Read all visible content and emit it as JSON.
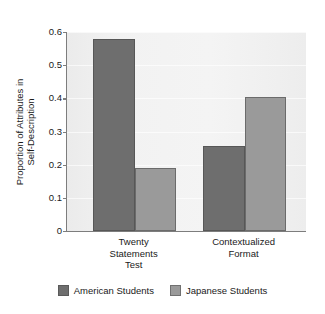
{
  "chart_data": {
    "type": "bar",
    "title": "",
    "subtitle": "",
    "xlabel": "",
    "ylabel": "Proportion of Attributes in Self-Description",
    "ylabel_lines": [
      "Proportion of Attributes in",
      "Self-Description"
    ],
    "categories": [
      "Twenty Statements Test",
      "Contextualized Format"
    ],
    "category_lines": [
      [
        "Twenty",
        "Statements",
        "Test"
      ],
      [
        "Contextualized",
        "Format"
      ]
    ],
    "series": [
      {
        "name": "American Students",
        "color": "#6e6e6e",
        "values": [
          0.58,
          0.255
        ]
      },
      {
        "name": "Japanese Students",
        "color": "#9a9a9a",
        "values": [
          0.19,
          0.405
        ]
      }
    ],
    "ylim": [
      0,
      0.6
    ],
    "yticks": [
      0,
      0.1,
      0.2,
      0.3,
      0.4,
      0.5,
      0.6
    ],
    "ytick_labels": [
      "0",
      "0.1",
      "0.2",
      "0.3",
      "0.4",
      "0.5",
      "0.6"
    ],
    "grid": "horizontal-light",
    "legend_position": "bottom-center",
    "plot_background": "#f1f1f1",
    "axis_color": "#7d7d7d"
  },
  "legend": {
    "entries": [
      {
        "label": "American Students",
        "color": "#6e6e6e"
      },
      {
        "label": "Japanese Students",
        "color": "#9a9a9a"
      }
    ]
  }
}
